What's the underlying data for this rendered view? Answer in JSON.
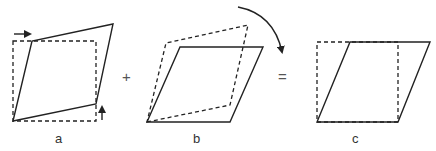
{
  "panels": [
    {
      "id": "a",
      "label": "a"
    },
    {
      "id": "b",
      "label": "b"
    },
    {
      "id": "c",
      "label": "c"
    }
  ],
  "operators": {
    "plus": "+",
    "equals": "="
  },
  "colors": {
    "stroke": "#222222",
    "background": "#ffffff"
  }
}
